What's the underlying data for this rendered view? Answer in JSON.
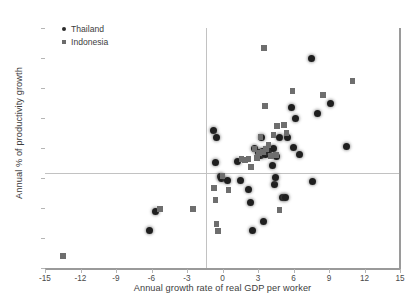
{
  "chart_data": {
    "type": "scatter",
    "title": "",
    "xlabel": "Annual growth rate of real GDP per worker",
    "ylabel": "Annual % of productivity growth",
    "xlim": [
      -15,
      15
    ],
    "ylim": [
      -9,
      15
    ],
    "xticks": [
      "-15",
      "-12",
      "-9",
      "-6",
      "-3",
      "0",
      "3",
      "6",
      "9",
      "12",
      "15"
    ],
    "yticks": [
      "15",
      "12",
      "9",
      "6",
      "3",
      "0",
      "-3",
      "-6",
      "-9"
    ],
    "grid": false,
    "legend_position": "top-left",
    "series": [
      {
        "name": "Thailand",
        "marker": "circle",
        "color": "#1f1f1f",
        "points": [
          [
            -5.7,
            -3.3
          ],
          [
            -6.2,
            -5.2
          ],
          [
            -0.8,
            4.8
          ],
          [
            -0.5,
            4.1
          ],
          [
            -0.6,
            1.6
          ],
          [
            -0.2,
            0.2
          ],
          [
            -0.1,
            0.0
          ],
          [
            0.4,
            -0.2
          ],
          [
            1.3,
            1.7
          ],
          [
            1.5,
            -0.2
          ],
          [
            2.2,
            -1.1
          ],
          [
            2.4,
            -2.4
          ],
          [
            2.5,
            -5.2
          ],
          [
            2.7,
            3.0
          ],
          [
            3.0,
            2.6
          ],
          [
            3.2,
            2.3
          ],
          [
            3.3,
            4.1
          ],
          [
            3.4,
            2.7
          ],
          [
            3.5,
            -4.3
          ],
          [
            3.6,
            2.4
          ],
          [
            3.8,
            2.8
          ],
          [
            4.0,
            2.9
          ],
          [
            4.2,
            1.3
          ],
          [
            4.3,
            3.0
          ],
          [
            4.4,
            -0.6
          ],
          [
            4.5,
            0.1
          ],
          [
            4.6,
            2.2
          ],
          [
            4.8,
            4.1
          ],
          [
            5.1,
            -1.9
          ],
          [
            5.3,
            -1.9
          ],
          [
            5.5,
            4.1
          ],
          [
            5.8,
            7.1
          ],
          [
            6.0,
            3.1
          ],
          [
            6.2,
            6.0
          ],
          [
            6.5,
            2.4
          ],
          [
            7.5,
            12.0
          ],
          [
            7.6,
            -0.3
          ],
          [
            8.0,
            6.5
          ],
          [
            9.1,
            7.5
          ],
          [
            10.5,
            3.2
          ]
        ]
      },
      {
        "name": "Indonesia",
        "marker": "square",
        "color": "#6e6e6e",
        "points": [
          [
            -13.5,
            -7.8
          ],
          [
            -5.3,
            -3.1
          ],
          [
            -2.5,
            -3.1
          ],
          [
            -0.7,
            -1.0
          ],
          [
            -0.6,
            -2.2
          ],
          [
            -0.5,
            -4.6
          ],
          [
            -0.4,
            -5.3
          ],
          [
            0.0,
            0.2
          ],
          [
            0.5,
            -1.2
          ],
          [
            1.6,
            1.9
          ],
          [
            1.9,
            1.8
          ],
          [
            2.2,
            1.9
          ],
          [
            2.4,
            1.1
          ],
          [
            2.7,
            2.9
          ],
          [
            2.9,
            2.0
          ],
          [
            3.1,
            2.5
          ],
          [
            3.2,
            4.1
          ],
          [
            3.4,
            2.6
          ],
          [
            3.5,
            13.0
          ],
          [
            3.6,
            7.2
          ],
          [
            3.7,
            2.9
          ],
          [
            3.9,
            3.3
          ],
          [
            4.1,
            2.2
          ],
          [
            4.3,
            4.3
          ],
          [
            4.5,
            2.3
          ],
          [
            4.6,
            5.2
          ],
          [
            4.8,
            -3.2
          ],
          [
            5.2,
            5.3
          ],
          [
            5.4,
            4.5
          ],
          [
            5.9,
            8.7
          ],
          [
            8.5,
            8.3
          ],
          [
            11.0,
            9.7
          ]
        ]
      }
    ]
  }
}
